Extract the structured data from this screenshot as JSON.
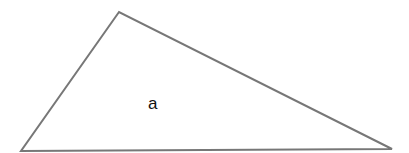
{
  "diagram": {
    "shape": "triangle",
    "vertices": [
      [
        119,
        12
      ],
      [
        21,
        151
      ],
      [
        392,
        149
      ]
    ],
    "stroke_color": "#777777",
    "fill_color": "#ffffff",
    "label": "a",
    "label_position": [
      149,
      109
    ]
  }
}
